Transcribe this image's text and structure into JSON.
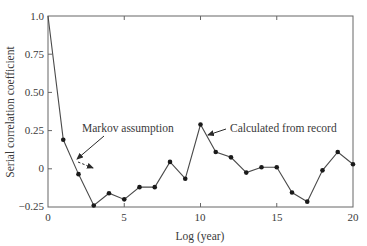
{
  "chart_data": {
    "type": "line",
    "title": "",
    "xlabel": "Log (year)",
    "ylabel": "Serial correlation coefficient",
    "xlim": [
      0,
      20
    ],
    "ylim": [
      -0.25,
      1.0
    ],
    "xticks": [
      "0",
      "5",
      "10",
      "15",
      "20"
    ],
    "yticks": [
      "1.0",
      "0.75",
      "0.50",
      "0.25",
      "0",
      "−0.25"
    ],
    "grid": false,
    "legend": null,
    "series": [
      {
        "name": "Calculated from record",
        "x": [
          0,
          1,
          2,
          3,
          4,
          5,
          6,
          7,
          8,
          9,
          10,
          11,
          12,
          13,
          14,
          15,
          16,
          17,
          18,
          19,
          20
        ],
        "values": [
          1.0,
          0.19,
          -0.035,
          -0.24,
          -0.16,
          -0.2,
          -0.12,
          -0.12,
          0.045,
          -0.065,
          0.29,
          0.11,
          0.075,
          -0.025,
          0.01,
          0.01,
          -0.155,
          -0.215,
          -0.01,
          0.11,
          0.03
        ]
      }
    ],
    "annotations": [
      {
        "text": "Markov assumption",
        "arrow": "solid pointing to curve near lag 1.5, with dashed arrow continuing down-right"
      },
      {
        "text": "Calculated from record",
        "arrow": "solid pointing to curve near lag 10.5"
      }
    ]
  },
  "labels": {
    "xlabel": "Log (year)",
    "ylabel": "Serial correlation coefficient",
    "markov": "Markov assumption",
    "calculated": "Calculated from record",
    "xticks": [
      "0",
      "5",
      "10",
      "15",
      "20"
    ],
    "yticks": [
      "1.0",
      "0.75",
      "0.50",
      "0.25",
      "0",
      "−0.25"
    ]
  },
  "colors": {
    "line": "#4a4a4a",
    "marker": "#1a1a1a",
    "axis": "#555555",
    "text": "#3a3a3a"
  }
}
